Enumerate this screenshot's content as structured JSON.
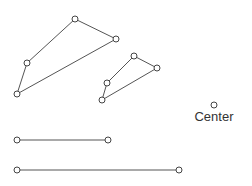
{
  "diagram": {
    "shapes": [
      {
        "name": "large-quadrilateral",
        "kind": "polygon",
        "vertex_count": 4
      },
      {
        "name": "small-quadrilateral",
        "kind": "polygon",
        "vertex_count": 4
      },
      {
        "name": "short-segment",
        "kind": "segment",
        "vertex_count": 2
      },
      {
        "name": "long-segment",
        "kind": "segment",
        "vertex_count": 2
      }
    ],
    "center": {
      "label": "Center"
    }
  }
}
